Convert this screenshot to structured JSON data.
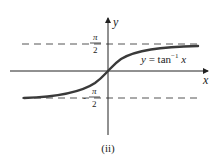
{
  "figure": {
    "caption": "(ii)",
    "curve_label": {
      "lhs": "y",
      "eq": " = tan",
      "sup": "−1",
      "arg": " x"
    },
    "axes": {
      "x_label": "x",
      "y_label": "y"
    },
    "asymptotes": {
      "upper": {
        "num": "π",
        "den": "2",
        "sign": ""
      },
      "lower": {
        "num": "π",
        "den": "2",
        "sign": "-"
      }
    },
    "colors": {
      "ink": "#222222",
      "curve": "#3a3a3a",
      "dash": "#555555"
    }
  }
}
